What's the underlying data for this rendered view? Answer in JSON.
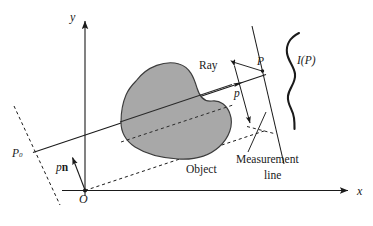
{
  "figure": {
    "type": "geometry-diagram",
    "title_visible": false,
    "background_color": "#ffffff",
    "stroke_color": "#1a1a1a",
    "object_fill_color": "#a8a8a8",
    "object_stroke_color": "#3c3c3c"
  },
  "axes": {
    "x_label": "x",
    "y_label": "y",
    "origin_label": "O"
  },
  "labels": {
    "ray": "Ray",
    "point_p": "P",
    "point_p0": "P",
    "point_p0_sub": "0",
    "intensity": "I(P)",
    "distance_p": "p",
    "vector_pn_scalar": "p",
    "vector_pn_unit": "n",
    "object": "Object",
    "measurement_line_1": "Measurement",
    "measurement_line_2": "line"
  }
}
